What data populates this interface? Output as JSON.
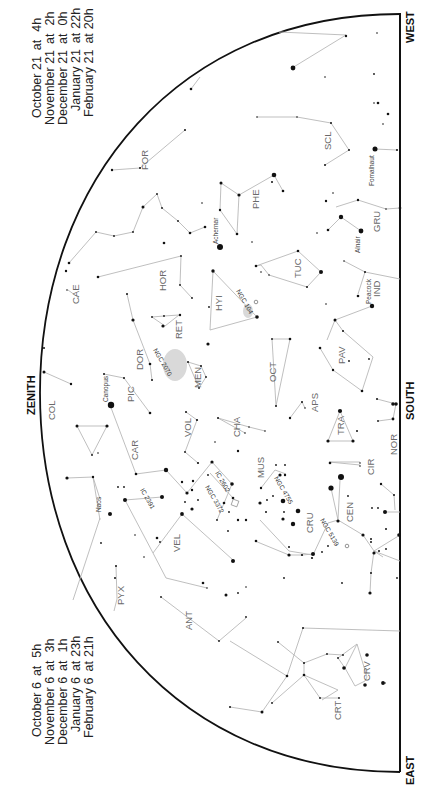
{
  "chart": {
    "type": "star-map",
    "orientation": "rotated-90",
    "horizon_directions": {
      "west": "WEST",
      "south": "SOUTH",
      "east": "EAST",
      "zenith": "ZENITH"
    },
    "times_west": [
      {
        "date": "October 21",
        "time": "4h"
      },
      {
        "date": "November 21",
        "time": "2h"
      },
      {
        "date": "December 21",
        "time": "0h"
      },
      {
        "date": "January 21",
        "time": "22h"
      },
      {
        "date": "February 21",
        "time": "20h"
      }
    ],
    "times_east": [
      {
        "date": "October 6",
        "time": "5h"
      },
      {
        "date": "November 6",
        "time": "3h"
      },
      {
        "date": "December 6",
        "time": "1h"
      },
      {
        "date": "January 6",
        "time": "23h"
      },
      {
        "date": "February 6",
        "time": "21h"
      }
    ],
    "at_word": "at",
    "constellations": [
      "FOR",
      "SCL",
      "PHE",
      "GRU",
      "CAE",
      "HOR",
      "HYI",
      "TUC",
      "IND",
      "RET",
      "DOR",
      "MEN",
      "OCT",
      "PAV",
      "COL",
      "PIC",
      "APS",
      "VOL",
      "CHA",
      "TRA",
      "CAR",
      "MUS",
      "CIR",
      "NOR",
      "CRU",
      "CEN",
      "VEL",
      "PYX",
      "ANT",
      "CRV",
      "CRT"
    ],
    "named_stars": [
      "Fomalhaut",
      "Achernar",
      "Alnair",
      "Peacock",
      "Canopus",
      "Naos"
    ],
    "deep_sky": [
      "NGC 104",
      "NGC 2070",
      "IC 2391",
      "IC 2602",
      "NGC 3372",
      "NGC 4755",
      "NGC 5139"
    ],
    "colors": {
      "lines": "#b8b8b8",
      "stars": "#111111",
      "labels": "#6a6a6a",
      "horizon": "#111111"
    }
  },
  "labels": {
    "FOR": "FOR",
    "SCL": "SCL",
    "PHE": "PHE",
    "GRU": "GRU",
    "CAE": "CAE",
    "HOR": "HOR",
    "HYI": "HYI",
    "TUC": "TUC",
    "IND": "IND",
    "RET": "RET",
    "DOR": "DOR",
    "MEN": "MEN",
    "OCT": "OCT",
    "PAV": "PAV",
    "COL": "COL",
    "PIC": "PIC",
    "APS": "APS",
    "VOL": "VOL",
    "CHA": "CHA",
    "TRA": "TRA",
    "CAR": "CAR",
    "MUS": "MUS",
    "CIR": "CIR",
    "NOR": "NOR",
    "CRU": "CRU",
    "CEN": "CEN",
    "VEL": "VEL",
    "PYX": "PYX",
    "ANT": "ANT",
    "CRV": "CRV",
    "CRT": "CRT",
    "Fomalhaut": "Fomalhaut",
    "Achernar": "Achernar",
    "Alnair": "Alnair",
    "Peacock": "Peacock",
    "Canopus": "Canopus",
    "Naos": "Naos",
    "NGC104": "NGC 104",
    "NGC2070": "NGC 2070",
    "IC2391": "IC 2391",
    "IC2602": "IC 2602",
    "NGC3372": "NGC 3372",
    "NGC4755": "NGC 4755",
    "NGC5139": "NGC 5139"
  }
}
